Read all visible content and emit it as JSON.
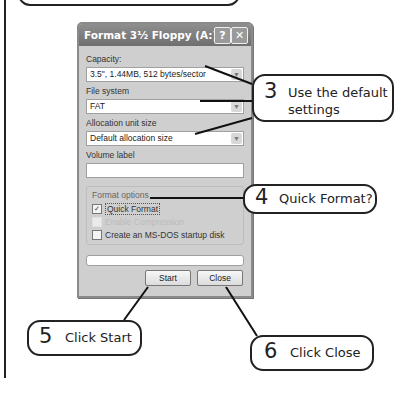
{
  "dialog": {
    "title": "Format 3½ Floppy (A:)",
    "help_button": "?",
    "close_button": "✕",
    "capacity_label": "Capacity:",
    "capacity_value": "3.5\",  1.44MB, 512 bytes/sector",
    "file_system_label": "File system",
    "file_system_value": "FAT",
    "allocation_label": "Allocation unit size",
    "allocation_value": "Default allocation size",
    "volume_label": "Volume label",
    "volume_value": "",
    "format_options_title": "Format options",
    "options": [
      {
        "label": "Quick Format",
        "checked": true,
        "enabled": true
      },
      {
        "label": "Enable Compression",
        "checked": false,
        "enabled": false
      },
      {
        "label": "Create an MS-DOS startup disk",
        "checked": false,
        "enabled": true
      }
    ],
    "progress_percent": 0,
    "start_label": "Start",
    "close_label": "Close",
    "dropdown_arrow": "▼",
    "check_mark": "✓"
  },
  "callouts": [
    {
      "number": "3",
      "text_line1": "Use the default",
      "text_line2": "settings"
    },
    {
      "number": "4",
      "text": "Quick Format?"
    },
    {
      "number": "5",
      "text": "Click Start"
    },
    {
      "number": "6",
      "text": "Click Close"
    }
  ]
}
